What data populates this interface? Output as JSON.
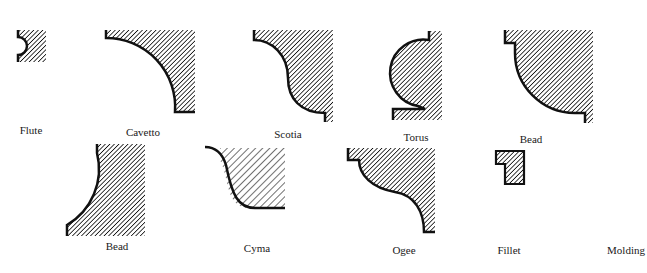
{
  "title": "Molding",
  "colors": {
    "ink": "#111111",
    "paper": "#ffffff"
  },
  "profiles": [
    {
      "id": "flute",
      "label": "Flute",
      "row": 1
    },
    {
      "id": "cavetto",
      "label": "Cavetto",
      "row": 1
    },
    {
      "id": "scotia",
      "label": "Scotia",
      "row": 1
    },
    {
      "id": "torus",
      "label": "Torus",
      "row": 1
    },
    {
      "id": "bead-top",
      "label": "Bead",
      "row": 1
    },
    {
      "id": "bead-bottom",
      "label": "Bead",
      "row": 2
    },
    {
      "id": "cyma",
      "label": "Cyma",
      "row": 2
    },
    {
      "id": "ogee",
      "label": "Ogee",
      "row": 2
    },
    {
      "id": "fillet",
      "label": "Fillet",
      "row": 2
    }
  ],
  "caption": "Molding"
}
